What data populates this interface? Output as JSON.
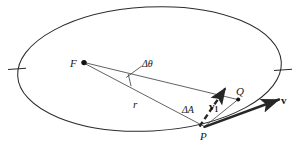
{
  "figure": {
    "type": "geometry-diagram",
    "background_color": "#ffffff",
    "stroke_color": "#262626",
    "text_color": "#161616",
    "width": 299,
    "height": 151
  },
  "labels": {
    "focus": "F",
    "delta_theta": "Δθ",
    "radius": "r",
    "delta_area": "ΔA",
    "velocity_1_base": "v",
    "velocity_1_sub": "1",
    "point_q": "Q",
    "point_p": "P",
    "velocity": "v"
  },
  "geometry": {
    "ellipse": {
      "cx": 149.5,
      "cy": 69,
      "rx": 132,
      "ry": 62,
      "rotation_deg": -3
    },
    "axis_ticks": [
      {
        "name": "left-vertex-tick",
        "x": 16,
        "y": 69
      },
      {
        "name": "right-vertex-tick",
        "x": 283,
        "y": 69
      }
    ],
    "points": [
      {
        "name": "F",
        "x": 83,
        "y": 62,
        "marker": "filled-dot"
      },
      {
        "name": "P",
        "x": 205,
        "y": 127,
        "marker": "none"
      },
      {
        "name": "Q",
        "x": 238,
        "y": 99,
        "marker": "filled-dot"
      }
    ],
    "segments": [
      {
        "name": "radius-F-to-P",
        "from": "F",
        "to": "P",
        "style": "thin-solid"
      },
      {
        "name": "radius-F-to-Q",
        "from": "F",
        "to": "Q",
        "style": "thin-solid"
      },
      {
        "name": "chord-P-to-Q",
        "from": "P",
        "to": "Q",
        "style": "thin-solid"
      }
    ],
    "angle_arc": {
      "name": "delta-theta-arc",
      "vertex": "F",
      "between": [
        "radius-F-to-Q",
        "radius-F-to-P"
      ]
    },
    "vectors": [
      {
        "name": "velocity-v",
        "from": [
          205,
          127
        ],
        "to": [
          283,
          100
        ],
        "style": "bold-solid-arrow",
        "label": "v"
      },
      {
        "name": "velocity-v1",
        "from": [
          199,
          126
        ],
        "to": [
          227,
          84
        ],
        "style": "bold-dashed-arrow",
        "label": "v1"
      }
    ],
    "leader_lines": [
      {
        "name": "delta-theta-leader",
        "from": [
          140,
          66
        ],
        "to": [
          126,
          78
        ]
      }
    ]
  }
}
